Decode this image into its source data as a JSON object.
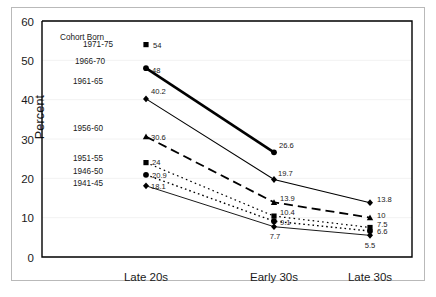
{
  "figure": {
    "ylabel": "Percent",
    "legend_title": "Cohort Born",
    "ylim": [
      0,
      60
    ],
    "yticks": [
      "0",
      "10",
      "20",
      "30",
      "40",
      "50",
      "60"
    ],
    "xcats": [
      "Late 20s",
      "Early 30s",
      "Late 30s"
    ]
  },
  "chart_data": {
    "type": "line",
    "title": "",
    "xlabel": "",
    "ylabel": "Percent",
    "ylim": [
      0,
      60
    ],
    "yticks": [
      0,
      10,
      20,
      30,
      40,
      50,
      60
    ],
    "grid": true,
    "legend": "inline-left-labels",
    "categories": [
      "Late 20s",
      "Early 30s",
      "Late 30s"
    ],
    "series": [
      {
        "name": "1971-75",
        "marker": "square",
        "line": "none",
        "width": 0,
        "values": [
          54,
          null,
          null
        ],
        "labels": [
          "54",
          "",
          ""
        ]
      },
      {
        "name": "1966-70",
        "marker": "circle",
        "line": "solid",
        "width": 2.6,
        "values": [
          48,
          26.6,
          null
        ],
        "labels": [
          "48",
          "26.6",
          ""
        ]
      },
      {
        "name": "1961-65",
        "marker": "diamond",
        "line": "solid",
        "width": 1.1,
        "values": [
          40.2,
          19.7,
          13.8
        ],
        "labels": [
          "40.2",
          "19.7",
          "13.8"
        ]
      },
      {
        "name": "1956-60",
        "marker": "triangle",
        "line": "long-dash",
        "width": 1.8,
        "values": [
          30.6,
          13.9,
          10
        ],
        "labels": [
          "30.6",
          "13.9",
          "10"
        ]
      },
      {
        "name": "1951-55",
        "marker": "square",
        "line": "none",
        "width": 0,
        "values": [
          24,
          10.4,
          7.5
        ],
        "labels": [
          "24",
          "10.4",
          "7.5"
        ]
      },
      {
        "name": "1946-50",
        "marker": "circle",
        "line": "dotted",
        "width": 1.4,
        "values": [
          20.9,
          9.1,
          6.6
        ],
        "labels": [
          "20.9",
          "9.1",
          "6.6"
        ]
      },
      {
        "name": "1941-45",
        "marker": "diamond",
        "line": "solid",
        "width": 0.9,
        "values": [
          18.1,
          7.7,
          5.5
        ],
        "labels": [
          "18.1",
          "7.7",
          "5.5"
        ]
      }
    ]
  },
  "colors": {
    "axis": "#000000",
    "grid": "#f2f2f2",
    "outer_border": "#b9b9b9",
    "text": "#1a1a1a"
  }
}
